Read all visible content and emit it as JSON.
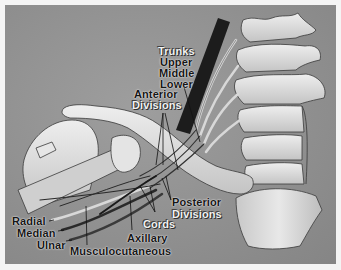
{
  "diagram": {
    "labels": {
      "trunks": "Trunks",
      "upper": "Upper",
      "middle": "Middle",
      "lower": "Lower",
      "anterior": "Anterior",
      "anterior_divisions": "Divisions",
      "posterior": "Posterior",
      "posterior_divisions": "Divisions",
      "cords": "Cords",
      "axillary": "Axillary",
      "musculocutaneous": "Musculocutaneous",
      "radial": "Radial",
      "median": "Median",
      "ulnar": "Ulnar"
    },
    "colors": {
      "background": "#8f8f8f",
      "bone": "#dcdcdc",
      "nerve_dark": "#2a2a2a",
      "muscle_dark": "#1a1a1a",
      "frame": "#f4f4f4"
    }
  }
}
